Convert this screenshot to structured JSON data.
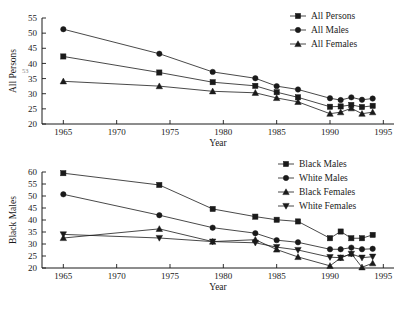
{
  "figure": {
    "background": "#ffffff",
    "ink_color": "#1a1a1a"
  },
  "chart_data": [
    {
      "id": "top",
      "type": "line",
      "title": "",
      "xlabel": "Year",
      "ylabel": "All Persons",
      "xlim": [
        1963,
        1996
      ],
      "ylim": [
        20,
        55
      ],
      "xticks": [
        1965,
        1970,
        1975,
        1980,
        1985,
        1990,
        1995
      ],
      "xticklabels": [
        "1965",
        "1970",
        "1975",
        "1980",
        "1985",
        "1990",
        "1995"
      ],
      "yticks": [
        20,
        25,
        30,
        35,
        40,
        45,
        50,
        55
      ],
      "yticklabels": [
        "20",
        "25",
        "30",
        "35",
        "40",
        "45",
        "50",
        "55"
      ],
      "grid": false,
      "legend_position": "top-right",
      "x": [
        1965,
        1974,
        1979,
        1983,
        1985,
        1987,
        1990,
        1991,
        1992,
        1993,
        1994
      ],
      "series": [
        {
          "name": "All Persons",
          "marker": "square",
          "values": [
            42.3,
            37.0,
            33.8,
            32.6,
            30.5,
            28.8,
            25.7,
            25.8,
            26.3,
            25.6,
            26.0
          ]
        },
        {
          "name": "All Males",
          "marker": "circle",
          "values": [
            51.3,
            43.2,
            37.2,
            35.1,
            32.5,
            31.4,
            28.5,
            27.9,
            28.8,
            28.0,
            28.4
          ]
        },
        {
          "name": "All Females",
          "marker": "triangle-up",
          "values": [
            34.1,
            32.5,
            30.8,
            30.3,
            28.6,
            27.3,
            23.4,
            23.9,
            25.2,
            23.4,
            23.9
          ]
        }
      ]
    },
    {
      "id": "bottom",
      "type": "line",
      "title": "",
      "xlabel": "Year",
      "ylabel": "Black Males",
      "xlim": [
        1963,
        1996
      ],
      "ylim": [
        20,
        60
      ],
      "xticks": [
        1965,
        1970,
        1975,
        1980,
        1985,
        1990,
        1995
      ],
      "xticklabels": [
        "1965",
        "1970",
        "1975",
        "1980",
        "1985",
        "1990",
        "1995"
      ],
      "yticks": [
        20,
        25,
        30,
        35,
        40,
        45,
        50,
        55,
        60
      ],
      "yticklabels": [
        "20",
        "25",
        "30",
        "35",
        "40",
        "45",
        "50",
        "55",
        "60"
      ],
      "grid": false,
      "legend_position": "top-right",
      "x": [
        1965,
        1974,
        1979,
        1983,
        1985,
        1987,
        1990,
        1991,
        1992,
        1993,
        1994
      ],
      "series": [
        {
          "name": "Black Males",
          "marker": "square",
          "values": [
            59.5,
            54.6,
            44.6,
            41.4,
            40.1,
            39.4,
            32.4,
            35.2,
            32.4,
            32.4,
            33.8
          ]
        },
        {
          "name": "White Males",
          "marker": "circle",
          "values": [
            50.7,
            42.0,
            36.8,
            34.5,
            31.6,
            30.7,
            27.8,
            27.8,
            28.5,
            27.8,
            28.0
          ]
        },
        {
          "name": "Black Females",
          "marker": "triangle-up",
          "values": [
            32.5,
            36.3,
            31.0,
            31.8,
            27.7,
            24.6,
            20.9,
            24.2,
            26.0,
            20.3,
            22.0
          ]
        },
        {
          "name": "White Females",
          "marker": "triangle-down",
          "values": [
            34.0,
            32.5,
            31.0,
            30.5,
            28.7,
            27.5,
            24.5,
            24.3,
            25.9,
            24.3,
            24.7
          ]
        }
      ]
    }
  ],
  "artifact": {
    "ghost_text": "53"
  }
}
